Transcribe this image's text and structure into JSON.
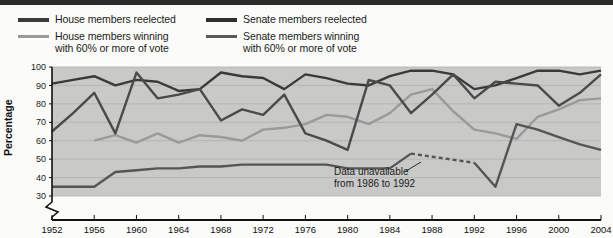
{
  "chart_data": {
    "type": "line",
    "title": "",
    "xlabel": "",
    "ylabel": "Percentage",
    "xlim": [
      1952,
      2004
    ],
    "ylim": [
      30,
      100
    ],
    "grid": true,
    "legend_position": "top",
    "yticks": [
      30,
      40,
      50,
      60,
      70,
      80,
      90,
      100
    ],
    "xticks": [
      1952,
      1956,
      1960,
      1964,
      1968,
      1972,
      1976,
      1980,
      1984,
      1988,
      1992,
      1996,
      2000,
      2004
    ],
    "axis_break": true,
    "annotations": [
      {
        "text": "Data unavailable\nfrom 1986 to 1992",
        "line1": "Data unavailable",
        "line2": "from 1986 to 1992",
        "x": 1984,
        "y": 42
      }
    ],
    "series": [
      {
        "name": "House members reelected",
        "color": "#3a3a3a",
        "style": "solid",
        "x": [
          1952,
          1954,
          1956,
          1958,
          1960,
          1962,
          1964,
          1966,
          1968,
          1970,
          1972,
          1974,
          1976,
          1978,
          1980,
          1982,
          1984,
          1986,
          1988,
          1990,
          1992,
          1994,
          1996,
          1998,
          2000,
          2002,
          2004
        ],
        "values": [
          91,
          93,
          95,
          90,
          93,
          92,
          87,
          88,
          97,
          95,
          94,
          88,
          96,
          94,
          91,
          90,
          95,
          98,
          98,
          96,
          88,
          90,
          94,
          98,
          98,
          96,
          98
        ]
      },
      {
        "name": "House members winning with 60% or more of vote",
        "color": "#9a9a9a",
        "style": "solid",
        "x": [
          1956,
          1958,
          1960,
          1962,
          1964,
          1966,
          1968,
          1970,
          1972,
          1974,
          1976,
          1978,
          1980,
          1982,
          1984,
          1986,
          1988,
          1990,
          1992,
          1994,
          1996,
          1998,
          2000,
          2002,
          2004
        ],
        "values": [
          60,
          63,
          59,
          64,
          59,
          63,
          62,
          60,
          66,
          67,
          69,
          74,
          73,
          69,
          75,
          85,
          88,
          76,
          66,
          64,
          61,
          73,
          77,
          82,
          83
        ]
      },
      {
        "name": "Senate members reelected",
        "color": "#4a4a4a",
        "style": "solid",
        "x": [
          1952,
          1954,
          1956,
          1958,
          1960,
          1962,
          1964,
          1966,
          1968,
          1970,
          1972,
          1974,
          1976,
          1978,
          1980,
          1982,
          1984,
          1986,
          1988,
          1990,
          1992,
          1994,
          1996,
          1998,
          2000,
          2002,
          2004
        ],
        "values": [
          65,
          75,
          86,
          64,
          97,
          83,
          85,
          88,
          71,
          77,
          74,
          85,
          64,
          60,
          55,
          93,
          90,
          75,
          85,
          96,
          83,
          92,
          91,
          90,
          79,
          86,
          96
        ]
      },
      {
        "name": "Senate members winning with 60% or more of vote",
        "color": "#555555",
        "style": "solid-with-dashed-gap",
        "dashed_from": 1986,
        "dashed_to": 1992,
        "x": [
          1952,
          1954,
          1956,
          1958,
          1960,
          1962,
          1964,
          1966,
          1968,
          1970,
          1972,
          1974,
          1976,
          1978,
          1980,
          1982,
          1984,
          1986,
          1992,
          1994,
          1996,
          1998,
          2000,
          2002,
          2004
        ],
        "values": [
          35,
          35,
          35,
          43,
          44,
          45,
          45,
          46,
          46,
          47,
          47,
          47,
          47,
          47,
          45,
          45,
          45,
          53,
          48,
          35,
          69,
          66,
          62,
          58,
          55
        ]
      }
    ]
  },
  "legend": {
    "items": [
      {
        "label": "House members reelected",
        "color": "#3a3a3a",
        "column": "left"
      },
      {
        "label": "House members winning\nwith 60% or more of vote",
        "color": "#9a9a9a",
        "column": "left"
      },
      {
        "label": "Senate members reelected",
        "color": "#2f2f2f",
        "column": "right"
      },
      {
        "label": "Senate members winning\nwith 60% or more of vote",
        "color": "#5a5a5a",
        "column": "right"
      }
    ]
  },
  "axes": {
    "ylabel": "Percentage",
    "ytick_labels": [
      "100",
      "90",
      "80",
      "70",
      "60",
      "50",
      "40",
      "30"
    ],
    "xtick_labels": [
      "1952",
      "1956",
      "1960",
      "1964",
      "1968",
      "1972",
      "1976",
      "1980",
      "1984",
      "1988",
      "1992",
      "1996",
      "2000",
      "2004"
    ]
  },
  "annotation": {
    "line1": "Data unavailable",
    "line2": "from 1986 to 1992"
  },
  "colors": {
    "plot_background": "#c9c9c7",
    "gridline": "#b0b0ae",
    "axis": "#111111",
    "page_background": "#fbfbf9"
  }
}
